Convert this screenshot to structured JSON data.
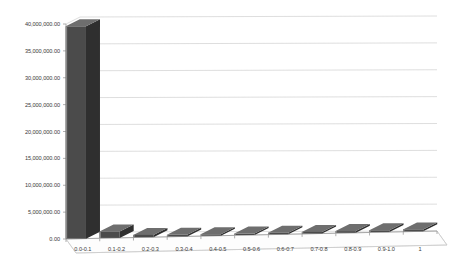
{
  "chart_data": {
    "type": "bar",
    "title": "",
    "subtitle": "",
    "xlabel": "",
    "ylabel": "",
    "categories": [
      "0.0-0.1",
      "0.1-0.2",
      "0.2-0.3",
      "0.3-0.4",
      "0.4-0.5",
      "0.5-0.6",
      "0.6-0.7",
      "0.7-0.8",
      "0.8-0.9",
      "0.9-1.0",
      "1"
    ],
    "values": [
      39500000,
      1200000,
      420000,
      300000,
      260000,
      260000,
      280000,
      300000,
      320000,
      330000,
      360000
    ],
    "series": [
      {
        "name": "Series 1",
        "values": [
          39500000,
          1200000,
          420000,
          300000,
          260000,
          260000,
          280000,
          300000,
          320000,
          330000,
          360000
        ]
      }
    ],
    "ylim": [
      0,
      40000000
    ],
    "ytick_values": [
      0,
      5000000,
      10000000,
      15000000,
      20000000,
      25000000,
      30000000,
      35000000,
      40000000
    ],
    "ytick_labels": [
      "0.00",
      "5,000,000.00",
      "10,000,000.00",
      "15,000,000.00",
      "20,000,000.00",
      "25,000,000.00",
      "30,000,000.00",
      "35,000,000.00",
      "40,000,000.00"
    ],
    "grid": true,
    "legend": false,
    "legend_position": "none",
    "style": "3d-column",
    "colors": {
      "bar_front": "#4b4b4b",
      "bar_top": "#6e6e6e",
      "bar_side": "#2f2f2f",
      "bar_highlight": "#8a8a8a",
      "gridline": "#d0d0d0",
      "axis": "#9a9a9a",
      "floor": "#fbfbfb",
      "background": "#ffffff",
      "text": "#3a3a3a"
    }
  }
}
